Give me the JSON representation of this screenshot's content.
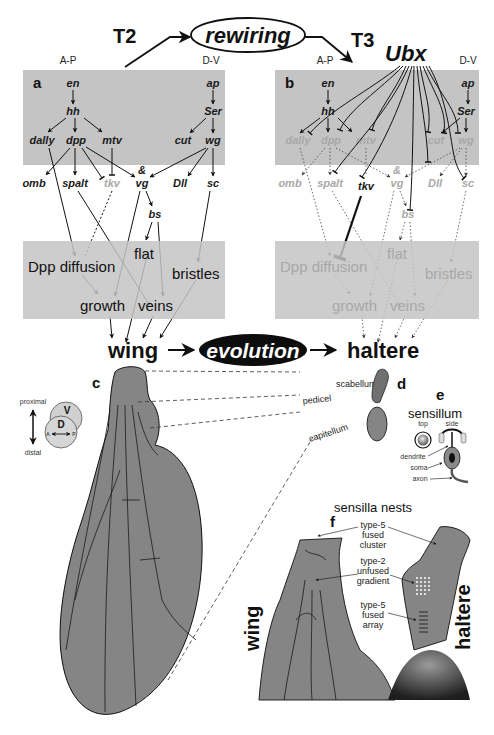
{
  "header": {
    "t2_label": "T2",
    "t3_label": "T3",
    "rewiring_label": "rewiring",
    "ubx_label": "Ubx"
  },
  "panel_a": {
    "letter": "a",
    "axis_ap": "A-P",
    "axis_dv": "D-V",
    "genes": {
      "en": "en",
      "hh": "hh",
      "dally": "dally",
      "dpp": "dpp",
      "mtv": "mtv",
      "omb": "omb",
      "spalt": "spalt",
      "tkv": "tkv",
      "vg": "vg",
      "amp": "&",
      "bs": "bs",
      "ap": "ap",
      "Ser": "Ser",
      "cut": "cut",
      "wg": "wg",
      "Dll": "Dll",
      "sc": "sc"
    },
    "phenotypes": {
      "dpp_diffusion": "Dpp diffusion",
      "flat": "flat",
      "bristles": "bristles",
      "growth": "growth",
      "veins": "veins"
    }
  },
  "panel_b": {
    "letter": "b",
    "axis_ap": "A-P",
    "axis_dv": "D-V",
    "genes": {
      "en": "en",
      "hh": "hh",
      "dally": "dally",
      "dpp": "dpp",
      "mtv": "mtv",
      "omb": "omb",
      "spalt": "spalt",
      "tkv": "tkv",
      "vg": "vg",
      "amp": "&",
      "bs": "bs",
      "ap": "ap",
      "Ser": "Ser",
      "cut": "cut",
      "wg": "wg",
      "Dll": "Dll",
      "sc": "sc"
    },
    "phenotypes": {
      "dpp_diffusion": "Dpp diffusion",
      "flat": "flat",
      "bristles": "bristles",
      "growth": "growth",
      "veins": "veins"
    }
  },
  "evolution_row": {
    "wing": "wing",
    "evolution": "evolution",
    "haltere": "haltere"
  },
  "panel_c": {
    "letter": "c",
    "proximal": "proximal",
    "distal": "distal",
    "v": "V",
    "d": "D",
    "a": "A",
    "p": "P"
  },
  "panel_d": {
    "letter": "d",
    "scabellum": "scabellum",
    "pedicel": "pedicel",
    "capitellum": "capitellum"
  },
  "panel_e": {
    "letter": "e",
    "title": "sensillum",
    "top": "top",
    "side": "side",
    "dendrite": "dendrite",
    "soma": "soma",
    "axon": "axon"
  },
  "panel_f": {
    "letter": "f",
    "title": "sensilla nests",
    "type5_cluster": [
      "type-5",
      "fused",
      "cluster"
    ],
    "type2_gradient": [
      "type-2",
      "unfused",
      "gradient"
    ],
    "type5_array": [
      "type-5",
      "fused",
      "array"
    ],
    "wing_label": "wing",
    "haltere_label": "haltere"
  },
  "colors": {
    "panel_gray": "#c4c4c4",
    "wing_fill": "#858585",
    "dim_text": "#a8a8a8",
    "ink": "#111111"
  }
}
